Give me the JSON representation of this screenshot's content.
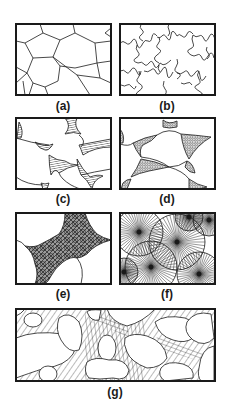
{
  "figure": {
    "panels": [
      {
        "id": "a",
        "label": "(a)",
        "description": "polygonal grain boundaries"
      },
      {
        "id": "b",
        "label": "(b)",
        "description": "sutured / interlocking grain boundaries"
      },
      {
        "id": "c",
        "label": "(c)",
        "description": "rounded grains with hatched cement in pore triangles"
      },
      {
        "id": "d",
        "label": "(d)",
        "description": "rounded grains with coated pore rims"
      },
      {
        "id": "e",
        "label": "(e)",
        "description": "fibrous radiating cement filling pore space"
      },
      {
        "id": "f",
        "label": "(f)",
        "description": "spherulitic radiating fan structures"
      },
      {
        "id": "g",
        "label": "(g)",
        "description": "rounded grains in striated / banded matrix"
      }
    ]
  },
  "colors": {
    "ink": "#1a1a1a",
    "background": "#ffffff"
  }
}
